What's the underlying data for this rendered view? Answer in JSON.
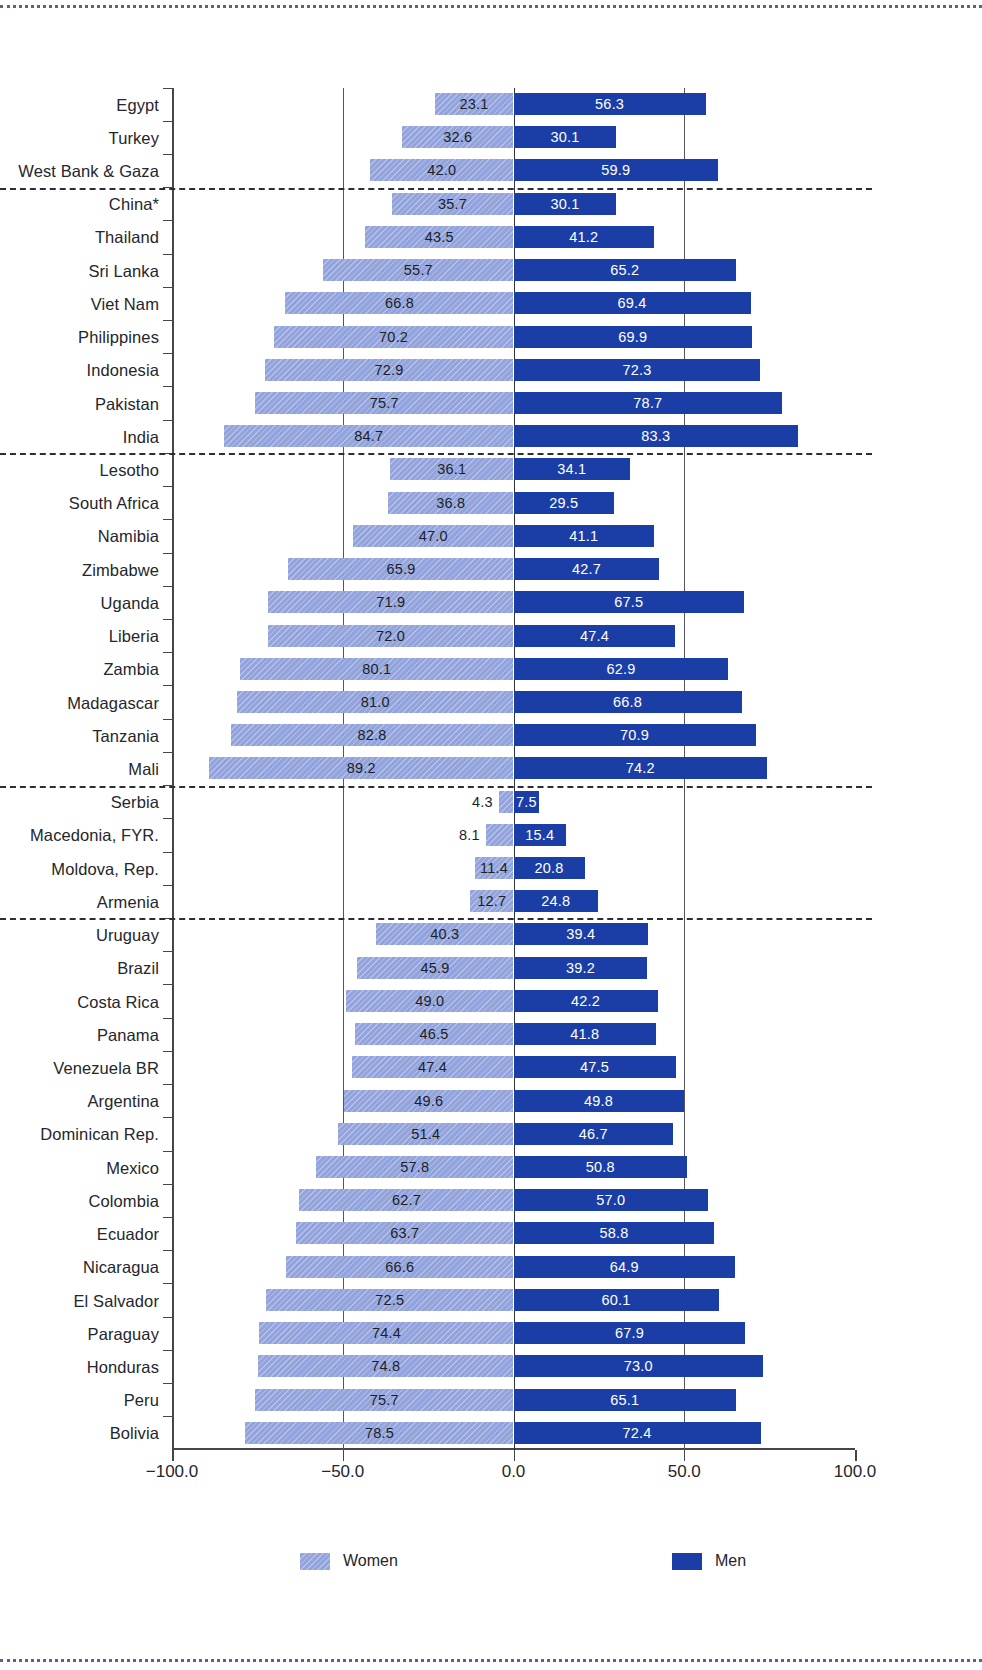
{
  "chart_data": {
    "type": "bar",
    "orientation": "horizontal",
    "style": "diverging-population-pyramid",
    "title": "",
    "xlabel": "",
    "ylabel": "",
    "xlim": [
      -100.0,
      100.0
    ],
    "xticks": [
      -100.0,
      -50.0,
      0.0,
      50.0,
      100.0
    ],
    "xticklabels": [
      "−100.0",
      "−50.0",
      "0.0",
      "50.0",
      "100.0"
    ],
    "grid": true,
    "gridlines_at": [
      -50.0,
      0.0,
      50.0
    ],
    "legend_position": "bottom",
    "legend": [
      {
        "name": "Women",
        "color": "#93a4dd",
        "side": "left"
      },
      {
        "name": "Men",
        "color": "#1b3ea6",
        "side": "right"
      }
    ],
    "series": [
      {
        "name": "Women",
        "color": "#93a4dd"
      },
      {
        "name": "Men",
        "color": "#1b3ea6"
      }
    ],
    "categories": [
      "Egypt",
      "Turkey",
      "West Bank & Gaza",
      "China*",
      "Thailand",
      "Sri Lanka",
      "Viet Nam",
      "Philippines",
      "Indonesia",
      "Pakistan",
      "India",
      "Lesotho",
      "South Africa",
      "Namibia",
      "Zimbabwe",
      "Uganda",
      "Liberia",
      "Zambia",
      "Madagascar",
      "Tanzania",
      "Mali",
      "Serbia",
      "Macedonia, FYR.",
      "Moldova, Rep.",
      "Armenia",
      "Uruguay",
      "Brazil",
      "Costa Rica",
      "Panama",
      "Venezuela BR",
      "Argentina",
      "Dominican Rep.",
      "Mexico",
      "Colombia",
      "Ecuador",
      "Nicaragua",
      "El Salvador",
      "Paraguay",
      "Honduras",
      "Peru",
      "Bolivia"
    ],
    "women": [
      23.1,
      32.6,
      42.0,
      35.7,
      43.5,
      55.7,
      66.8,
      70.2,
      72.9,
      75.7,
      84.7,
      36.1,
      36.8,
      47.0,
      65.9,
      71.9,
      72.0,
      80.1,
      81.0,
      82.8,
      89.2,
      4.3,
      8.1,
      11.4,
      12.7,
      40.3,
      45.9,
      49.0,
      46.5,
      47.4,
      49.6,
      51.4,
      57.8,
      62.7,
      63.7,
      66.6,
      72.5,
      74.4,
      74.8,
      75.7,
      78.5
    ],
    "men": [
      56.3,
      30.1,
      59.9,
      30.1,
      41.2,
      65.2,
      69.4,
      69.9,
      72.3,
      78.7,
      83.3,
      34.1,
      29.5,
      41.1,
      42.7,
      67.5,
      47.4,
      62.9,
      66.8,
      70.9,
      74.2,
      7.5,
      15.4,
      20.8,
      24.8,
      39.4,
      39.2,
      42.2,
      41.8,
      47.5,
      49.8,
      46.7,
      50.8,
      57.0,
      58.8,
      64.9,
      60.1,
      67.9,
      73.0,
      65.1,
      72.4
    ],
    "group_breaks_after": [
      2,
      10,
      20,
      24
    ]
  }
}
